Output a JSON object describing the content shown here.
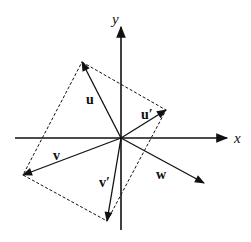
{
  "diagram": {
    "colors": {
      "stroke": "#111111",
      "background": "#ffffff"
    },
    "axes": {
      "x_label": "x",
      "y_label": "y"
    },
    "vectors": [
      {
        "id": "u",
        "label": "u"
      },
      {
        "id": "u_prime",
        "label": "u′"
      },
      {
        "id": "v",
        "label": "v"
      },
      {
        "id": "v_prime",
        "label": "v′"
      },
      {
        "id": "w",
        "label": "w"
      }
    ],
    "dashed_parallelogram": "rectangle connecting tips of u, u′, v′, v"
  }
}
